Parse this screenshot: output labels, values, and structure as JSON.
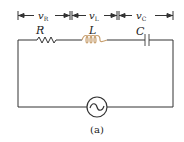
{
  "diagram": {
    "type": "series RLC circuit",
    "voltage_labels": [
      {
        "id": "vR",
        "main": "v",
        "sub": "R"
      },
      {
        "id": "vL",
        "main": "v",
        "sub": "L"
      },
      {
        "id": "vC",
        "main": "v",
        "sub": "C"
      }
    ],
    "components": [
      {
        "id": "resistor",
        "label": "R"
      },
      {
        "id": "inductor",
        "label": "L"
      },
      {
        "id": "capacitor",
        "label": "C"
      },
      {
        "id": "ac-source",
        "symbol": "~"
      }
    ],
    "caption": "(a)",
    "colors": {
      "wire": "#333333",
      "inductor": "#c8a070",
      "capacitor": "#888888"
    }
  }
}
